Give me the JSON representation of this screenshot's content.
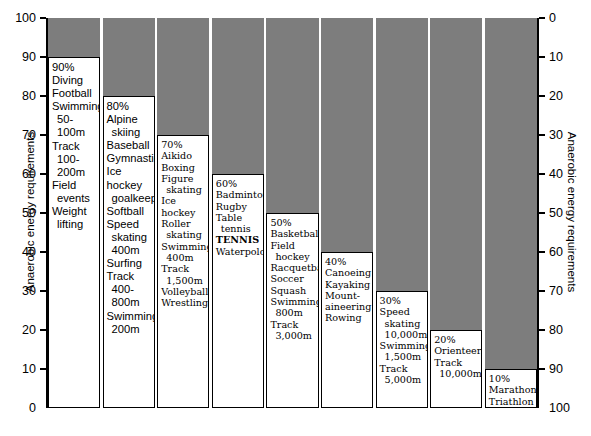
{
  "axes": {
    "left": {
      "title": "Anaerobic energy requirements",
      "ticks": [
        "100",
        "90",
        "80",
        "70",
        "60",
        "50",
        "40",
        "30",
        "20",
        "10",
        "0"
      ]
    },
    "right": {
      "title": "Anaerobic energy requirements",
      "ticks": [
        "0",
        "10",
        "20",
        "30",
        "40",
        "50",
        "60",
        "70",
        "80",
        "90",
        "100"
      ]
    }
  },
  "colors": {
    "bar_fill": "#7d7d7d",
    "box_fill": "#ffffff",
    "stroke": "#000000"
  },
  "chart_data": {
    "type": "bar",
    "title": "",
    "xlabel": "",
    "ylabel": "Anaerobic energy requirements",
    "ylim": [
      0,
      100
    ],
    "grid": false,
    "legend": "none",
    "categories": [
      "90%",
      "80%",
      "70%",
      "60%",
      "50%",
      "40%",
      "30%",
      "20%",
      "10%"
    ],
    "values": [
      90,
      80,
      70,
      60,
      50,
      40,
      30,
      20,
      10
    ],
    "secondary_axis": {
      "label": "Anaerobic energy requirements",
      "ylim": [
        100,
        0
      ],
      "inverted": true
    },
    "columns": [
      {
        "percent_label": "90%",
        "value": 90,
        "font": "sans",
        "entries": [
          {
            "text": "Diving",
            "indent": false,
            "bold": false
          },
          {
            "text": "Football",
            "indent": false,
            "bold": false
          },
          {
            "text": "Swimming",
            "indent": false,
            "bold": false
          },
          {
            "text": "50-100m",
            "indent": true,
            "bold": false
          },
          {
            "text": "Track",
            "indent": false,
            "bold": false
          },
          {
            "text": "100-200m",
            "indent": true,
            "bold": false
          },
          {
            "text": "Field",
            "indent": false,
            "bold": false
          },
          {
            "text": "events",
            "indent": true,
            "bold": false
          },
          {
            "text": "Weight",
            "indent": false,
            "bold": false
          },
          {
            "text": "lifting",
            "indent": true,
            "bold": false
          }
        ]
      },
      {
        "percent_label": "80%",
        "value": 80,
        "font": "sans",
        "entries": [
          {
            "text": "Alpine",
            "indent": false,
            "bold": false
          },
          {
            "text": "skiing",
            "indent": true,
            "bold": false
          },
          {
            "text": "Baseball",
            "indent": false,
            "bold": false
          },
          {
            "text": "Gymnastics",
            "indent": false,
            "bold": false
          },
          {
            "text": "Ice hockey",
            "indent": false,
            "bold": false
          },
          {
            "text": "goalkeeper",
            "indent": true,
            "bold": false
          },
          {
            "text": "Softball",
            "indent": false,
            "bold": false
          },
          {
            "text": "Speed",
            "indent": false,
            "bold": false
          },
          {
            "text": "skating",
            "indent": true,
            "bold": false
          },
          {
            "text": "400m",
            "indent": true,
            "bold": false
          },
          {
            "text": "Surfing",
            "indent": false,
            "bold": false
          },
          {
            "text": "Track",
            "indent": false,
            "bold": false
          },
          {
            "text": "400-800m",
            "indent": true,
            "bold": false
          },
          {
            "text": "Swimming",
            "indent": false,
            "bold": false
          },
          {
            "text": "200m",
            "indent": true,
            "bold": false
          }
        ]
      },
      {
        "percent_label": "70%",
        "value": 70,
        "font": "serif",
        "entries": [
          {
            "text": "Aikido",
            "indent": false,
            "bold": false
          },
          {
            "text": "Boxing",
            "indent": false,
            "bold": false
          },
          {
            "text": "Figure",
            "indent": false,
            "bold": false
          },
          {
            "text": "skating",
            "indent": true,
            "bold": false
          },
          {
            "text": "Ice hockey",
            "indent": false,
            "bold": false
          },
          {
            "text": "Roller",
            "indent": false,
            "bold": false
          },
          {
            "text": "skating",
            "indent": true,
            "bold": false
          },
          {
            "text": "Swimming",
            "indent": false,
            "bold": false
          },
          {
            "text": "400m",
            "indent": true,
            "bold": false
          },
          {
            "text": "Track",
            "indent": false,
            "bold": false
          },
          {
            "text": "1,500m",
            "indent": true,
            "bold": false
          },
          {
            "text": "Volleyball",
            "indent": false,
            "bold": false
          },
          {
            "text": "Wrestling",
            "indent": false,
            "bold": false
          }
        ]
      },
      {
        "percent_label": "60%",
        "value": 60,
        "font": "serif",
        "entries": [
          {
            "text": "Badminton",
            "indent": false,
            "bold": false
          },
          {
            "text": "Rugby",
            "indent": false,
            "bold": false
          },
          {
            "text": "Table",
            "indent": false,
            "bold": false
          },
          {
            "text": "tennis",
            "indent": true,
            "bold": false
          },
          {
            "text": "TENNIS",
            "indent": false,
            "bold": true
          },
          {
            "text": "Waterpolo",
            "indent": false,
            "bold": false
          }
        ]
      },
      {
        "percent_label": "50%",
        "value": 50,
        "font": "serif",
        "entries": [
          {
            "text": "Basketball",
            "indent": false,
            "bold": false
          },
          {
            "text": "Field",
            "indent": false,
            "bold": false
          },
          {
            "text": "hockey",
            "indent": true,
            "bold": false
          },
          {
            "text": "Racquetball",
            "indent": false,
            "bold": false
          },
          {
            "text": "Soccer",
            "indent": false,
            "bold": false
          },
          {
            "text": "Squash",
            "indent": false,
            "bold": false
          },
          {
            "text": "Swimming",
            "indent": false,
            "bold": false
          },
          {
            "text": "800m",
            "indent": true,
            "bold": false
          },
          {
            "text": "Track",
            "indent": false,
            "bold": false
          },
          {
            "text": "3,000m",
            "indent": true,
            "bold": false
          }
        ]
      },
      {
        "percent_label": "40%",
        "value": 40,
        "font": "serif",
        "entries": [
          {
            "text": "Canoeing",
            "indent": false,
            "bold": false
          },
          {
            "text": "Kayaking",
            "indent": false,
            "bold": false
          },
          {
            "text": "Mount-",
            "indent": false,
            "bold": false
          },
          {
            "text": "aineering",
            "indent": false,
            "bold": false
          },
          {
            "text": "Rowing",
            "indent": false,
            "bold": false
          }
        ]
      },
      {
        "percent_label": "30%",
        "value": 30,
        "font": "serif",
        "entries": [
          {
            "text": "Speed",
            "indent": false,
            "bold": false
          },
          {
            "text": "skating",
            "indent": true,
            "bold": false
          },
          {
            "text": "10,000m",
            "indent": true,
            "bold": false
          },
          {
            "text": "Swimming",
            "indent": false,
            "bold": false
          },
          {
            "text": "1,500m",
            "indent": true,
            "bold": false
          },
          {
            "text": "Track",
            "indent": false,
            "bold": false
          },
          {
            "text": "5,000m",
            "indent": true,
            "bold": false
          }
        ]
      },
      {
        "percent_label": "20%",
        "value": 20,
        "font": "serif",
        "entries": [
          {
            "text": "Orienteering",
            "indent": false,
            "bold": false
          },
          {
            "text": "Track",
            "indent": false,
            "bold": false
          },
          {
            "text": "10,000m",
            "indent": true,
            "bold": false
          }
        ]
      },
      {
        "percent_label": "10%",
        "value": 10,
        "font": "serif",
        "entries": [
          {
            "text": "Marathon",
            "indent": false,
            "bold": false
          },
          {
            "text": "Triathlon",
            "indent": false,
            "bold": false
          }
        ]
      }
    ]
  }
}
